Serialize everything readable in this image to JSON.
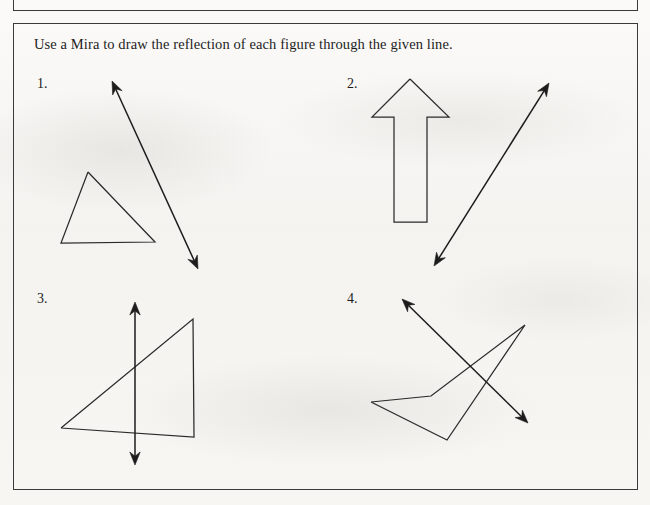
{
  "page": {
    "background_color": "#f6f5f3",
    "ink_color": "#2a2a2a",
    "border_color": "#3a3a3a",
    "width": 650,
    "height": 505
  },
  "instruction": {
    "text": "Use a Mira to draw the reflection of each figure through the given line."
  },
  "problems": [
    {
      "number": "1.",
      "figure_type": "triangle",
      "figure_points": "88,172 61,243 155,242 88,172",
      "mirror_line": {
        "x1": 112,
        "y1": 81,
        "x2": 198,
        "y2": 269
      }
    },
    {
      "number": "2.",
      "figure_type": "block-arrow-up",
      "figure_points": "410,79 372,117 394,117 394,222 427,222 427,117 449,117 410,79",
      "mirror_line": {
        "x1": 434,
        "y1": 266,
        "x2": 549,
        "y2": 83
      }
    },
    {
      "number": "3.",
      "figure_type": "right-triangle",
      "figure_points": "61,428 193,319 194,437 61,428",
      "mirror_line": {
        "x1": 135,
        "y1": 302,
        "x2": 135,
        "y2": 465
      }
    },
    {
      "number": "4.",
      "figure_type": "concave-dart",
      "figure_points": "371,402 431,396 525,325 447,440 371,402",
      "mirror_line": {
        "x1": 402,
        "y1": 299,
        "x2": 528,
        "y2": 423
      }
    }
  ]
}
